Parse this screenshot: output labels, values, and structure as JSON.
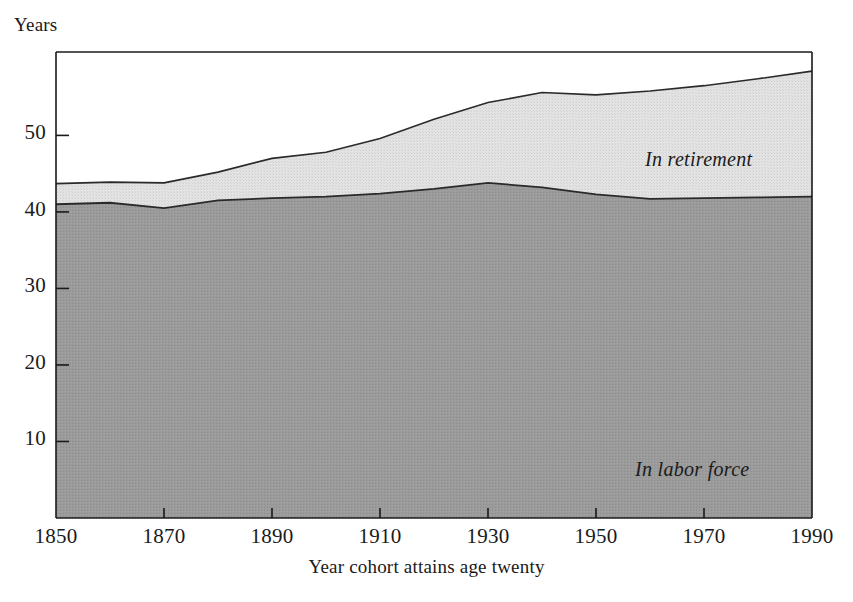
{
  "axes": {
    "y_title": "Years",
    "x_title": "Year cohort attains age twenty",
    "y_ticks": [
      "10",
      "20",
      "30",
      "40",
      "50"
    ],
    "x_ticks": [
      "1850",
      "1870",
      "1890",
      "1910",
      "1930",
      "1950",
      "1970",
      "1990"
    ]
  },
  "labels": {
    "retirement": "In retirement",
    "labor": "In labor force"
  },
  "colors": {
    "labor_fill": "#969696",
    "retirement_fill": "#dcdcdc",
    "axis": "#1a1a1a",
    "line": "#2a2a2a"
  },
  "chart_data": {
    "type": "area",
    "title": "",
    "subtitle": "",
    "xlabel": "Year cohort attains age twenty",
    "ylabel": "Years",
    "stacked": true,
    "grid": false,
    "legend": "inline-annotations",
    "xlim": [
      1850,
      1990
    ],
    "ylim": [
      0,
      60
    ],
    "x": [
      1850,
      1860,
      1870,
      1880,
      1890,
      1900,
      1910,
      1920,
      1930,
      1940,
      1950,
      1960,
      1970,
      1980,
      1990
    ],
    "series": [
      {
        "name": "In labor force",
        "values": [
          41.0,
          41.2,
          40.5,
          41.5,
          41.8,
          42.0,
          42.4,
          43.0,
          43.8,
          43.2,
          42.3,
          41.7,
          41.8,
          41.9,
          42.0
        ]
      },
      {
        "name": "In retirement",
        "values": [
          2.7,
          2.7,
          3.3,
          3.7,
          5.2,
          5.8,
          7.2,
          9.1,
          10.5,
          12.4,
          13.0,
          14.1,
          14.7,
          15.5,
          16.4
        ]
      }
    ],
    "totals": [
      43.7,
      43.9,
      43.8,
      45.2,
      47.0,
      47.8,
      49.6,
      52.1,
      54.3,
      55.6,
      55.3,
      55.8,
      56.5,
      57.4,
      58.4
    ]
  }
}
